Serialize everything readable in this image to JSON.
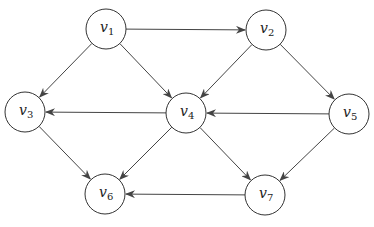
{
  "graph": {
    "radius": 20,
    "nodes": [
      {
        "id": "v1",
        "base": "v",
        "sub": "1",
        "x": 106,
        "y": 29
      },
      {
        "id": "v2",
        "base": "v",
        "sub": "2",
        "x": 266,
        "y": 30
      },
      {
        "id": "v3",
        "base": "v",
        "sub": "3",
        "x": 25,
        "y": 112
      },
      {
        "id": "v4",
        "base": "v",
        "sub": "4",
        "x": 186,
        "y": 113
      },
      {
        "id": "v5",
        "base": "v",
        "sub": "5",
        "x": 349,
        "y": 114
      },
      {
        "id": "v6",
        "base": "v",
        "sub": "6",
        "x": 105,
        "y": 194
      },
      {
        "id": "v7",
        "base": "v",
        "sub": "7",
        "x": 265,
        "y": 195
      }
    ],
    "edges": [
      {
        "from": "v1",
        "to": "v2"
      },
      {
        "from": "v1",
        "to": "v3"
      },
      {
        "from": "v1",
        "to": "v4"
      },
      {
        "from": "v2",
        "to": "v4"
      },
      {
        "from": "v2",
        "to": "v5"
      },
      {
        "from": "v4",
        "to": "v3"
      },
      {
        "from": "v5",
        "to": "v4"
      },
      {
        "from": "v3",
        "to": "v6"
      },
      {
        "from": "v4",
        "to": "v6"
      },
      {
        "from": "v4",
        "to": "v7"
      },
      {
        "from": "v5",
        "to": "v7"
      },
      {
        "from": "v7",
        "to": "v6"
      }
    ],
    "colors": {
      "stroke": "#333333",
      "edge": "#444444",
      "fill": "#ffffff"
    }
  }
}
